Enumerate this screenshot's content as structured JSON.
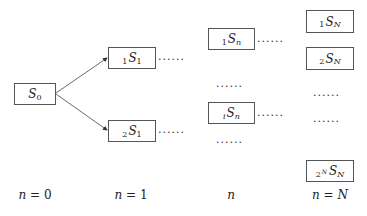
{
  "nodes": {
    "s0": {
      "prefix": "",
      "symbol": "S",
      "sub": "0"
    },
    "s1_1": {
      "prefix": "1",
      "symbol": "S",
      "sub": "1"
    },
    "s1_2": {
      "prefix": "2",
      "symbol": "S",
      "sub": "1"
    },
    "sn_1": {
      "prefix": "1",
      "symbol": "S",
      "sub": "n"
    },
    "sn_i": {
      "prefix": "i",
      "symbol": "S",
      "sub": "n"
    },
    "sN_1": {
      "prefix": "1",
      "symbol": "S",
      "sub": "N"
    },
    "sN_2": {
      "prefix": "2",
      "symbol": "S",
      "sub": "N"
    },
    "sN_2N": {
      "prefix": "2",
      "prefix_sup": "N",
      "symbol": "S",
      "sub": "N"
    }
  },
  "dots": "......",
  "stage_labels": [
    {
      "var": "n",
      "eq": " = ",
      "val": "0"
    },
    {
      "var": "n",
      "eq": " = ",
      "val": "1"
    },
    {
      "var": "n",
      "eq": "",
      "val": ""
    },
    {
      "var": "n",
      "eq": " = ",
      "val": "N"
    }
  ]
}
